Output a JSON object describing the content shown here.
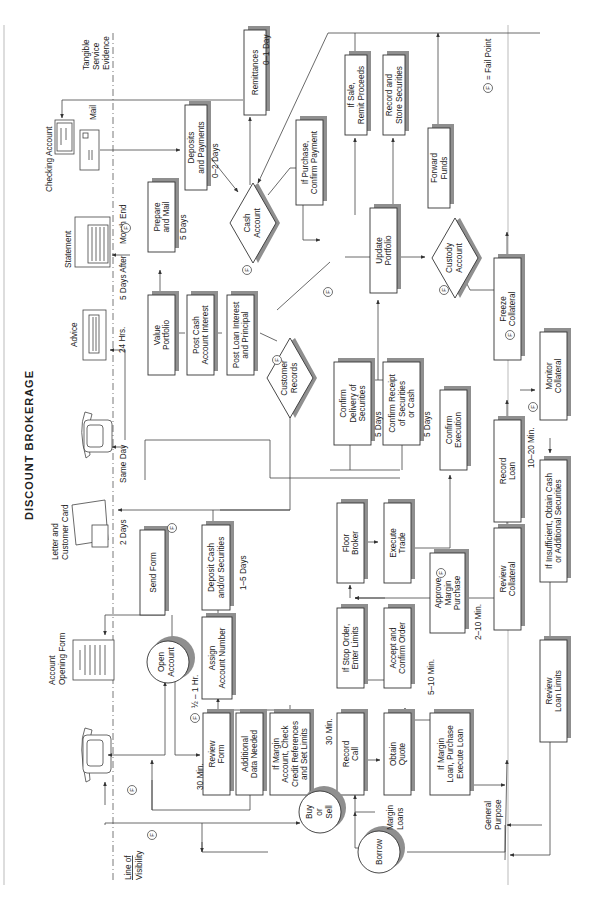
{
  "title": "DISCOUNT BROKERAGE",
  "legend": {
    "symbol": "F",
    "text": "= Fail Point"
  },
  "zones": {
    "line_of_visibility": [
      "Line of",
      "Visibility"
    ],
    "tangible_evidence": [
      "Tangible",
      "Service",
      "Evidence"
    ]
  },
  "evidence": {
    "account_opening_form": [
      "Account",
      "Opening Form"
    ],
    "letter_card": [
      "Letter and",
      "Customer Card"
    ],
    "advice": [
      "Advice"
    ],
    "statement": [
      "Statement"
    ],
    "checking_account": [
      "Checking Account"
    ],
    "mail": [
      "Mail"
    ]
  },
  "circles": {
    "open_account": [
      "Open",
      "Account"
    ],
    "buy_sell": [
      "Buy",
      "or",
      "Sell"
    ],
    "borrow": [
      "Borrow"
    ]
  },
  "diamonds": {
    "customer_records": [
      "Customer",
      "Records"
    ],
    "cash_account": [
      "Cash",
      "Account"
    ],
    "custody_account": [
      "Custody",
      "Account"
    ]
  },
  "boxes": {
    "send_form": [
      "Send Form"
    ],
    "deposit_cash": [
      "Deposit Cash",
      "and/or Securities"
    ],
    "assign_account": [
      "Assign",
      "Account Number"
    ],
    "review_form": [
      "Review",
      "Form"
    ],
    "additional_data": [
      "Additional",
      "Data Needed"
    ],
    "margin_account": [
      "If Margin",
      "Account, Check",
      "Credit References",
      "and Set Limits"
    ],
    "record_call": [
      "Record",
      "Call"
    ],
    "obtain_quote": [
      "Obtain",
      "Quote"
    ],
    "margin_loan": [
      "If Margin",
      "Loan, Purchase",
      "Execute Loan"
    ],
    "stop_order": [
      "If Stop Order,",
      "Enter Limits"
    ],
    "accept_confirm": [
      "Accept and",
      "Confirm Order"
    ],
    "floor_broker": [
      "Floor",
      "Broker"
    ],
    "execute_trade": [
      "Execute",
      "Trade"
    ],
    "approve_margin": [
      "Approve",
      "Margin",
      "Purchase"
    ],
    "confirm_delivery": [
      "Confirm",
      "Delivery of",
      "Securities"
    ],
    "confirm_receipt": [
      "Confirm Receipt",
      "of Securities",
      "or Cash"
    ],
    "confirm_execution": [
      "Confirm",
      "Execution"
    ],
    "value_portfolio": [
      "Value",
      "Portfolio"
    ],
    "post_cash": [
      "Post Cash",
      "Account Interest"
    ],
    "post_loan": [
      "Post Loan Interest",
      "and Principal"
    ],
    "prepare_mail": [
      "Prepare",
      "and Mail"
    ],
    "deposits_payments": [
      "Deposits",
      "and Payments"
    ],
    "remittances": [
      "Remittances"
    ],
    "update_portfolio": [
      "Update",
      "Portfolio"
    ],
    "purchase_payment": [
      "If Purchase,",
      "Confirm Payment"
    ],
    "sale_proceeds": [
      "If Sale,",
      "Remit Proceeds"
    ],
    "record_store": [
      "Record and",
      "Store Securities"
    ],
    "forward_funds": [
      "Forward",
      "Funds"
    ],
    "freeze_collateral": [
      "Freeze",
      "Collateral"
    ],
    "monitor_collateral": [
      "Monitor",
      "Collateral"
    ],
    "record_loan": [
      "Record",
      "Loan"
    ],
    "review_collateral": [
      "Review",
      "Collateral"
    ],
    "review_loan_limits": [
      "Review",
      "Loan Limits"
    ],
    "insufficient": [
      "If Insufficient, Obtain Cash",
      "or Additional Securities"
    ]
  },
  "notes": {
    "half_hour": "½ – 1 Hr.",
    "thirty_min_a": "30 Min.",
    "thirty_min_b": "30 Min.",
    "one_five_days": "1–5 Days",
    "two_days": "2 Days",
    "same_day": "Same Day",
    "hrs24": "24 Hrs.",
    "five_days_after": "5 Days After",
    "month_end": "Month End",
    "five_days_prep": "5 Days",
    "zero_two_days": "0–2 Days",
    "zero_one_day": "0–1 Day",
    "five_ten_min": "5–10 Min.",
    "two_ten_min": "2–10 Min.",
    "ten_twenty_min": "10–20 Min.",
    "five_days_delivery": "5 Days",
    "five_days_receipt": "5 Days",
    "margin_loans": [
      "Margin",
      "Loans"
    ],
    "general_purpose": [
      "General",
      "Purpose"
    ]
  }
}
